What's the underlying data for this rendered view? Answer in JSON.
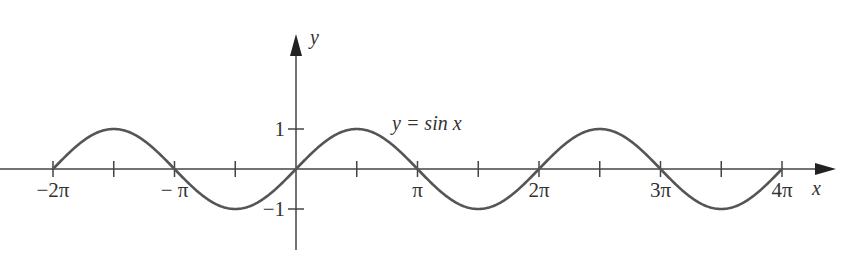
{
  "chart_data": {
    "type": "line",
    "title": "",
    "curve_label": "y = sin x",
    "xlabel": "x",
    "ylabel": "y",
    "x_ticks": [
      {
        "value": -6.2832,
        "label": "−2π"
      },
      {
        "value": -4.7124,
        "label": ""
      },
      {
        "value": -3.1416,
        "label": "− π"
      },
      {
        "value": -1.5708,
        "label": ""
      },
      {
        "value": 1.5708,
        "label": ""
      },
      {
        "value": 3.1416,
        "label": "π"
      },
      {
        "value": 4.7124,
        "label": ""
      },
      {
        "value": 6.2832,
        "label": "2π"
      },
      {
        "value": 7.854,
        "label": ""
      },
      {
        "value": 9.4248,
        "label": "3π"
      },
      {
        "value": 10.9956,
        "label": ""
      },
      {
        "value": 12.5664,
        "label": "4π"
      }
    ],
    "y_ticks": [
      {
        "value": 1,
        "label": "1"
      },
      {
        "value": -1,
        "label": "−1"
      }
    ],
    "xlim": [
      -6.2832,
      12.5664
    ],
    "ylim": [
      -1,
      1
    ],
    "series": [
      {
        "name": "sin x",
        "function": "sin",
        "x_range": [
          -6.2832,
          12.5664
        ],
        "color": "#555555"
      }
    ],
    "grid": false,
    "legend": "none"
  },
  "colors": {
    "axis": "#444444",
    "curve": "#555555",
    "text": "#333333"
  }
}
